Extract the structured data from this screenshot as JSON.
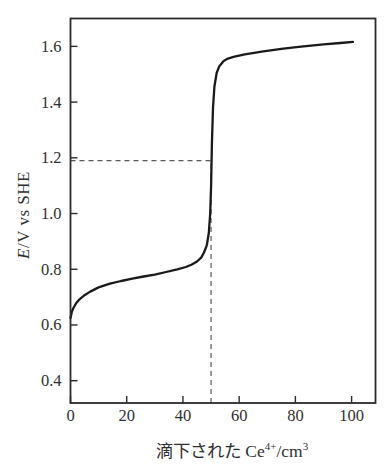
{
  "figure": {
    "background": "#ffffff",
    "frame_color": "#2b2b2b",
    "curve_color": "#1a1a1a",
    "dash_color": "#5a5a5a",
    "text_color": "#2f2f2f"
  },
  "y_axis_title": {
    "italic_part": "E",
    "rest_part": "/V vs SHE"
  },
  "x_axis_title": {
    "prefix": "滴下された Ce",
    "sup1": "4+",
    "mid": "/cm",
    "sup2": "3"
  },
  "chart_data": {
    "type": "line",
    "title": "",
    "xlabel": "滴下された Ce⁴⁺/cm³",
    "ylabel": "E/V vs SHE",
    "xlim": [
      0,
      108.5
    ],
    "ylim": [
      0.32,
      1.7
    ],
    "xticks": [
      0,
      20,
      40,
      60,
      80,
      100
    ],
    "yticks": [
      0.4,
      0.6,
      0.8,
      1.0,
      1.2,
      1.4,
      1.6
    ],
    "grid": false,
    "legend": false,
    "series": [
      {
        "name": "titration-curve",
        "x": [
          0,
          0.5,
          1,
          2,
          3,
          5,
          7,
          10,
          14,
          18,
          22,
          26,
          30,
          34,
          38,
          41,
          43,
          45,
          46.5,
          47.5,
          48.5,
          49.2,
          49.7,
          50,
          50.3,
          50.7,
          51.2,
          52,
          53,
          54.5,
          56,
          58,
          62,
          68,
          75,
          82,
          90,
          96,
          100.5
        ],
        "y": [
          0.625,
          0.648,
          0.66,
          0.678,
          0.69,
          0.707,
          0.72,
          0.735,
          0.748,
          0.758,
          0.766,
          0.774,
          0.781,
          0.79,
          0.8,
          0.808,
          0.816,
          0.828,
          0.842,
          0.86,
          0.886,
          0.93,
          1.0,
          1.1,
          1.25,
          1.38,
          1.455,
          1.505,
          1.53,
          1.548,
          1.556,
          1.562,
          1.571,
          1.581,
          1.591,
          1.599,
          1.607,
          1.612,
          1.616
        ]
      }
    ],
    "annotations": {
      "equivalence_volume": 50,
      "equivalence_potential": 1.19,
      "style": "dashed-guides"
    }
  }
}
